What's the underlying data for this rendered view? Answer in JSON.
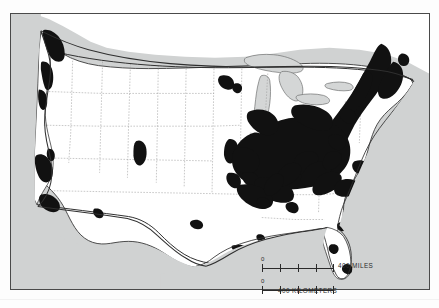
{
  "figure": {
    "caption_top": "",
    "title": "",
    "type": "thematic distribution map",
    "region": "Contiguous United States"
  },
  "map": {
    "frame": {
      "border_color": "#4a4a4a",
      "x": 10,
      "y": 13,
      "width": 420,
      "height": 277
    },
    "colors": {
      "land": "#ffffff",
      "water": "#d0d2d2",
      "lakes": "#d4d6d6",
      "shaded_distribution": "#111111",
      "state_border": "#8e8e8e",
      "national_border": "#3a3a3a",
      "coastline": "#3a3a3a"
    },
    "legend_note": "Black areas indicate the mapped distribution",
    "features": {
      "great_lakes": [
        "Lake Superior",
        "Lake Michigan",
        "Lake Huron",
        "Lake Erie",
        "Lake Ontario"
      ],
      "shaded_clusters": [
        "Puget Sound - Willamette Valley",
        "San Francisco Bay Area",
        "Southern California",
        "Phoenix area",
        "Denver area",
        "Omaha - Kansas City",
        "Minneapolis - St. Paul",
        "Texas interior point",
        "Houston - Gulf Coast",
        "New Orleans",
        "Northeast Megalopolis (Boston to Washington)",
        "Great Lakes industrial belt",
        "Ohio Valley and Appalachia",
        "Piedmont Carolinas",
        "Florida coastal points"
      ]
    }
  },
  "scale": {
    "miles": {
      "zero": "0",
      "max": "400",
      "unit_label": "400 MILES"
    },
    "kilometers": {
      "zero": "0",
      "max": "400",
      "unit_label": "400 KILOMETERS"
    },
    "ticks": 4
  }
}
